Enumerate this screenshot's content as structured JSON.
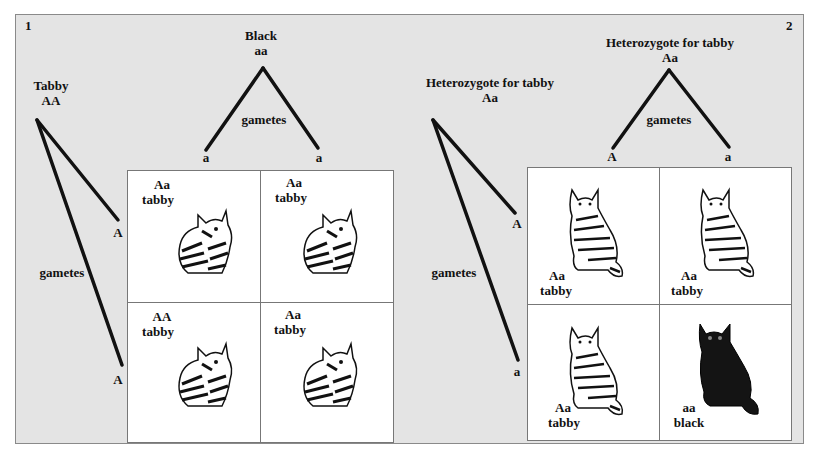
{
  "panel1": {
    "number": "1",
    "parent_top": {
      "phenotype": "Black",
      "genotype": "aa"
    },
    "parent_left": {
      "phenotype": "Tabby",
      "genotype": "AA"
    },
    "gametes_label_top": "gametes",
    "gametes_label_left": "gametes",
    "top_gametes": [
      "a",
      "a"
    ],
    "left_gametes": [
      "A",
      "A"
    ],
    "cells": [
      {
        "genotype": "Aa",
        "phenotype": "tabby",
        "cat": "tabby-cat-icon"
      },
      {
        "genotype": "Aa",
        "phenotype": "tabby",
        "cat": "tabby-cat-icon"
      },
      {
        "genotype": "AA",
        "phenotype": "tabby",
        "cat": "tabby-cat-icon"
      },
      {
        "genotype": "Aa",
        "phenotype": "tabby",
        "cat": "tabby-cat-icon"
      }
    ]
  },
  "panel2": {
    "number": "2",
    "parent_top": {
      "phenotype": "Heterozygote for tabby",
      "genotype": "Aa"
    },
    "parent_left": {
      "phenotype": "Heterozygote for tabby",
      "genotype": "Aa"
    },
    "gametes_label_top": "gametes",
    "gametes_label_left": "gametes",
    "top_gametes": [
      "A",
      "a"
    ],
    "left_gametes": [
      "A",
      "a"
    ],
    "cells": [
      {
        "genotype": "Aa",
        "phenotype": "tabby",
        "cat": "tabby-cat-icon"
      },
      {
        "genotype": "Aa",
        "phenotype": "tabby",
        "cat": "tabby-cat-icon"
      },
      {
        "genotype": "Aa",
        "phenotype": "tabby",
        "cat": "tabby-cat-icon"
      },
      {
        "genotype": "aa",
        "phenotype": "black",
        "cat": "black-cat-icon"
      }
    ]
  },
  "colors": {
    "background": "#e4e4e4",
    "grid": "#ffffff",
    "ink": "#111111"
  }
}
